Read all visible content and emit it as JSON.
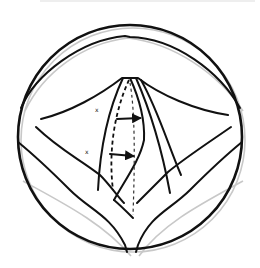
{
  "figure": {
    "markers": [
      {
        "label": "x",
        "x": 97,
        "y": 110
      },
      {
        "label": "x",
        "x": 87,
        "y": 152
      }
    ],
    "arrows": [
      {
        "from": [
          117,
          119
        ],
        "to": [
          140,
          118
        ]
      },
      {
        "from": [
          110,
          154
        ],
        "to": [
          133,
          156
        ]
      }
    ],
    "colors": {
      "ink": "#111111",
      "shadow": "#c8c8c8",
      "background": "#ffffff"
    }
  }
}
